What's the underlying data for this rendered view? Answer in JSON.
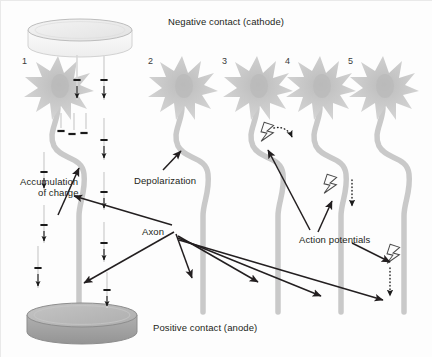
{
  "figure": {
    "title_top": "Negative contact (cathode)",
    "title_bottom": "Positive contact (anode)",
    "background": "#fdfdfd"
  },
  "colors": {
    "neuron_body": "#cfcfcf",
    "neuron_core": "#bdbdbd",
    "axon": "#c9c9c9",
    "electrode_top_face": "#e8e8e8",
    "electrode_top_side": "#f2f2f2",
    "electrode_bottom_face": "#b7b7b7",
    "electrode_bottom_side": "#9d9d9d",
    "ink": "#231f20",
    "charge_track": "#d8d8d8"
  },
  "labels": [
    {
      "id": "cathode",
      "text": "Negative contact (cathode)",
      "x": 168,
      "y": 21
    },
    {
      "id": "anode",
      "text": "Positive contact (anode)",
      "x": 153,
      "y": 326
    },
    {
      "id": "accumulation",
      "text": "Accumulation",
      "x": 20,
      "y": 178
    },
    {
      "id": "accumulation2",
      "text": "of charge",
      "x": 36,
      "y": 189
    },
    {
      "id": "depolarization",
      "text": "Depolarization",
      "x": 134,
      "y": 177
    },
    {
      "id": "axon",
      "text": "Axon",
      "x": 142,
      "y": 228
    },
    {
      "id": "action-potentials",
      "text": "Action potentials",
      "x": 299,
      "y": 236
    }
  ],
  "columns": [
    {
      "number": "1",
      "num_x": 22,
      "num_y": 56,
      "star_cx": 58,
      "star_cy": 88
    },
    {
      "number": "2",
      "num_x": 148,
      "num_y": 56,
      "star_cx": 182,
      "star_cy": 88
    },
    {
      "number": "3",
      "num_x": 222,
      "num_y": 56,
      "star_cx": 257,
      "star_cy": 88
    },
    {
      "number": "4",
      "num_x": 285,
      "num_y": 56,
      "star_cx": 320,
      "star_cy": 88
    },
    {
      "number": "5",
      "num_x": 348,
      "num_y": 56,
      "star_cx": 383,
      "star_cy": 88
    }
  ],
  "electrodes": [
    {
      "id": "cathode-disc",
      "cx": 80,
      "cy": 30,
      "rx": 52,
      "ry": 11,
      "depth": 16,
      "shade": "light"
    },
    {
      "id": "anode-disc",
      "cx": 82,
      "cy": 315,
      "rx": 55,
      "ry": 12,
      "depth": 17,
      "shade": "dark"
    }
  ],
  "charge_streams": [
    {
      "x": 77,
      "y1": 55,
      "y2": 100
    },
    {
      "x": 104,
      "y1": 55,
      "y2": 100
    },
    {
      "x": 61,
      "y1": 113,
      "y2": 133
    },
    {
      "x": 74,
      "y1": 113,
      "y2": 133
    },
    {
      "x": 86,
      "y1": 113,
      "y2": 133
    },
    {
      "x": 104,
      "y1": 118,
      "y2": 160
    },
    {
      "x": 44,
      "y1": 152,
      "y2": 190
    },
    {
      "x": 104,
      "y1": 172,
      "y2": 210
    },
    {
      "x": 44,
      "y1": 205,
      "y2": 243
    },
    {
      "x": 104,
      "y1": 222,
      "y2": 262
    },
    {
      "x": 38,
      "y1": 246,
      "y2": 288
    },
    {
      "x": 107,
      "y1": 272,
      "y2": 308
    }
  ],
  "accumulated_charges": [
    {
      "x": 61,
      "y": 131
    },
    {
      "x": 72,
      "y": 134
    },
    {
      "x": 84,
      "y": 133
    }
  ],
  "action_potentials": [
    {
      "column": "3",
      "bolt_x": 268,
      "bolt_y": 133,
      "arc": true,
      "dotted_arrow": false
    },
    {
      "column": "4",
      "bolt_x": 331,
      "bolt_y": 185,
      "arc": false,
      "dotted_arrow": true
    },
    {
      "column": "5",
      "bolt_x": 394,
      "bolt_y": 255,
      "arc": false,
      "dotted_arrow": true
    }
  ],
  "leader_arrows": [
    {
      "id": "accumulation-leader",
      "from": [
        58,
        215
      ],
      "to": [
        79,
        168
      ]
    },
    {
      "id": "depolarization-leader",
      "from": [
        163,
        170
      ],
      "to": [
        182,
        152
      ]
    },
    {
      "id": "axon-leader-1",
      "from": [
        172,
        225
      ],
      "to": [
        72,
        196
      ]
    },
    {
      "id": "axon-leader-2",
      "from": [
        174,
        232
      ],
      "to": [
        84,
        283
      ]
    },
    {
      "id": "axon-leader-3",
      "from": [
        176,
        234
      ],
      "to": [
        191,
        278
      ]
    },
    {
      "id": "axon-leader-4",
      "from": [
        178,
        236
      ],
      "to": [
        258,
        282
      ]
    },
    {
      "id": "axon-leader-5",
      "from": [
        178,
        238
      ],
      "to": [
        320,
        296
      ]
    },
    {
      "id": "axon-leader-6",
      "from": [
        179,
        240
      ],
      "to": [
        383,
        300
      ]
    },
    {
      "id": "ap-leader-3",
      "from": [
        310,
        230
      ],
      "to": [
        268,
        149
      ]
    },
    {
      "id": "ap-leader-4",
      "from": [
        318,
        232
      ],
      "to": [
        332,
        200
      ]
    },
    {
      "id": "ap-leader-5",
      "from": [
        352,
        243
      ],
      "to": [
        392,
        265
      ]
    }
  ]
}
